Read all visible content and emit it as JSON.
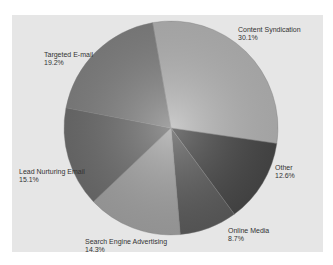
{
  "chart_data": {
    "type": "pie",
    "title": "",
    "start_angle_deg": -100,
    "direction": "clockwise",
    "center": [
      171,
      128
    ],
    "radius": 107,
    "slices": [
      {
        "label": "Content Syndication",
        "value": 30.1,
        "display": "30.1%",
        "color": "#b9b9b9"
      },
      {
        "label": "Other",
        "value": 12.6,
        "display": "12.6%",
        "color": "#4a4a4a"
      },
      {
        "label": "Online Media",
        "value": 8.7,
        "display": "8.7%",
        "color": "#5e5e5e"
      },
      {
        "label": "Search Engine Advertising",
        "value": 14.3,
        "display": "14.3%",
        "color": "#a6a6a6"
      },
      {
        "label": "Lead Nurturing Email",
        "value": 15.1,
        "display": "15.1%",
        "color": "#707070"
      },
      {
        "label": "Targeted E-mail",
        "value": 19.2,
        "display": "19.2%",
        "color": "#858585"
      }
    ],
    "legend": "none",
    "grid": false
  },
  "labels": [
    {
      "name": "Content Syndication",
      "pct": "30.1%",
      "x": 238,
      "y": 26
    },
    {
      "name": "Other",
      "pct": "12.6%",
      "x": 275,
      "y": 164
    },
    {
      "name": "Online Media",
      "pct": "8.7%",
      "x": 228,
      "y": 227
    },
    {
      "name": "Search Engine Advertising",
      "pct": "14.3%",
      "x": 85,
      "y": 238
    },
    {
      "name": "Lead Nurturing Email",
      "pct": "15.1%",
      "x": 19,
      "y": 168
    },
    {
      "name": "Targeted E-mail",
      "pct": "19.2%",
      "x": 44,
      "y": 51
    }
  ]
}
